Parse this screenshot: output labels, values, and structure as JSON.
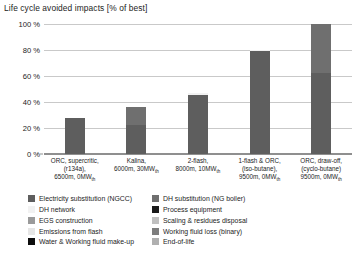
{
  "chart_data": {
    "type": "bar",
    "title": "Life cycle avoided impacts [% of best]",
    "xlabel": "",
    "ylabel": "",
    "ylim": [
      0,
      100
    ],
    "yticks": [
      "0 %",
      "20 %",
      "40 %",
      "60 %",
      "80 %",
      "100 %"
    ],
    "ytick_values": [
      0,
      20,
      40,
      60,
      80,
      100
    ],
    "grid": true,
    "legend_position": "bottom",
    "categories": [
      "ORC, supercritic, (r134a), 6500m, 0MWth",
      "Kalina, 6000m, 30MWth",
      "2-flash, 8000m, 10MWth",
      "1-flash & ORC, (iso-butane), 9500m, 0MWth",
      "ORC, draw-off, (cyclo-butane) 9500m, 0MWth"
    ],
    "category_lines": [
      [
        "ORC, supercritic,",
        "(r134a),",
        "6500m, 0MW",
        "th"
      ],
      [
        "Kalina,",
        "6000m, 30MW",
        "th"
      ],
      [
        "2-flash,",
        "8000m, 10MW",
        "th"
      ],
      [
        "1-flash & ORC,",
        "(iso-butane),",
        "9500m, 0MW",
        "th"
      ],
      [
        "ORC, draw-off,",
        "(cyclo-butane)",
        "9500m, 0MW",
        "th"
      ]
    ],
    "totals": [
      28,
      36,
      47,
      80,
      100
    ],
    "series": [
      {
        "name": "Electricity substitution (NGCC)",
        "color": "#5e5e5e",
        "values": [
          28,
          22,
          45.5,
          79,
          62
        ]
      },
      {
        "name": "DH substitution (NG boiler)",
        "color": "#6f6f6f",
        "values": [
          0,
          14,
          0,
          0,
          38
        ]
      },
      {
        "name": "DH network",
        "color": "#f2f2f2",
        "values": [
          0,
          0,
          1.5,
          1,
          0
        ]
      },
      {
        "name": "Process equipment",
        "color": "#1a1a1a",
        "values": [
          0,
          0,
          0,
          0,
          0
        ]
      },
      {
        "name": "EGS construction",
        "color": "#9a9a9a",
        "values": [
          0,
          0,
          0,
          0,
          0
        ]
      },
      {
        "name": "Scaling & residues disposal",
        "color": "#c0c0c0",
        "values": [
          0,
          0,
          0,
          0,
          0
        ]
      },
      {
        "name": "Emissions from flash",
        "color": "#e6e6e6",
        "values": [
          0,
          0,
          0,
          0,
          0
        ]
      },
      {
        "name": "Working fluid loss (binary)",
        "color": "#7d7d7d",
        "values": [
          0,
          0,
          0,
          0,
          0
        ]
      },
      {
        "name": "Water & Working fluid make-up",
        "color": "#0d0d0d",
        "values": [
          0,
          0,
          0,
          0,
          0
        ]
      },
      {
        "name": "End-of-life",
        "color": "#b0b0b0",
        "values": [
          0,
          0,
          0,
          0,
          0
        ]
      }
    ]
  },
  "legend": {
    "left_column": [
      {
        "label": "Electricity substitution (NGCC)",
        "color": "#5e5e5e"
      },
      {
        "label": "DH network",
        "color": "#f2f2f2"
      },
      {
        "label": "EGS construction",
        "color": "#9a9a9a"
      },
      {
        "label": "Emissions from flash",
        "color": "#e6e6e6"
      },
      {
        "label": "Water & Working fluid make-up",
        "color": "#0d0d0d"
      }
    ],
    "right_column": [
      {
        "label": "DH substitution (NG boiler)",
        "color": "#6f6f6f"
      },
      {
        "label": "Process equipment",
        "color": "#1a1a1a"
      },
      {
        "label": "Scaling & residues disposal",
        "color": "#c0c0c0"
      },
      {
        "label": "Working fluid loss (binary)",
        "color": "#7d7d7d"
      },
      {
        "label": "End-of-life",
        "color": "#b0b0b0"
      }
    ]
  }
}
